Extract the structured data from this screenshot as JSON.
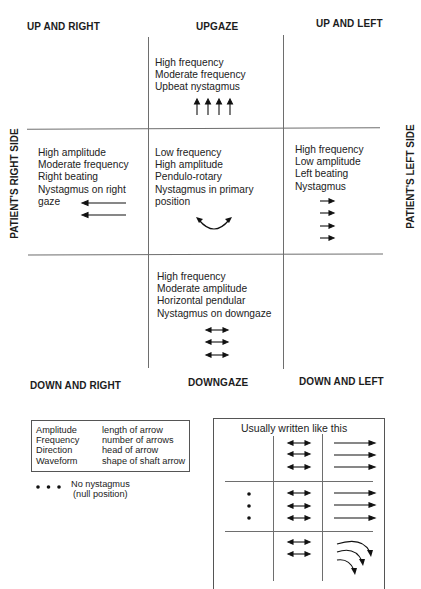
{
  "diagram": {
    "corners": {
      "up_right": "UP AND RIGHT",
      "upgaze": "UPGAZE",
      "up_left": "UP AND LEFT",
      "down_right": "DOWN AND RIGHT",
      "downgaze": "DOWNGAZE",
      "down_left": "DOWN AND LEFT"
    },
    "sides": {
      "right": "PATIENT'S RIGHT SIDE",
      "left": "PATIENT'S LEFT SIDE"
    },
    "cells": {
      "upgaze": {
        "lines": [
          "High frequency",
          "Moderate frequency",
          "Upbeat nystagmus"
        ],
        "arrows": {
          "type": "up",
          "count": 4
        }
      },
      "right_gaze": {
        "lines": [
          "High amplitude",
          "Moderate frequency",
          "Right beating",
          "Nystagmus on right",
          "gaze"
        ],
        "arrows": {
          "type": "left-long",
          "count": 2
        }
      },
      "primary": {
        "lines": [
          "Low frequency",
          "High amplitude",
          "Pendulo-rotary",
          "Nystagmus in primary",
          "position"
        ],
        "arrows": {
          "type": "curved-double",
          "count": 1
        }
      },
      "left_gaze": {
        "lines": [
          "High frequency",
          "Low amplitude",
          "Left beating",
          "Nystagmus"
        ],
        "arrows": {
          "type": "right-short",
          "count": 4
        }
      },
      "downgaze": {
        "lines": [
          "High frequency",
          "Moderate amplitude",
          "Horizontal pendular",
          "Nystagmus on downgaze"
        ],
        "arrows": {
          "type": "double-horizontal",
          "count": 3
        }
      }
    }
  },
  "legend": {
    "rows": [
      {
        "term": "Amplitude",
        "meaning": "length of arrow"
      },
      {
        "term": "Frequency",
        "meaning": "number of arrows"
      },
      {
        "term": "Direction",
        "meaning": "head of arrow"
      },
      {
        "term": "Waveform",
        "meaning": "shape of shaft arrow"
      }
    ],
    "null_label_1": "No nystagmus",
    "null_label_2": "(null position)"
  },
  "usual": {
    "title": "Usually written like this"
  }
}
